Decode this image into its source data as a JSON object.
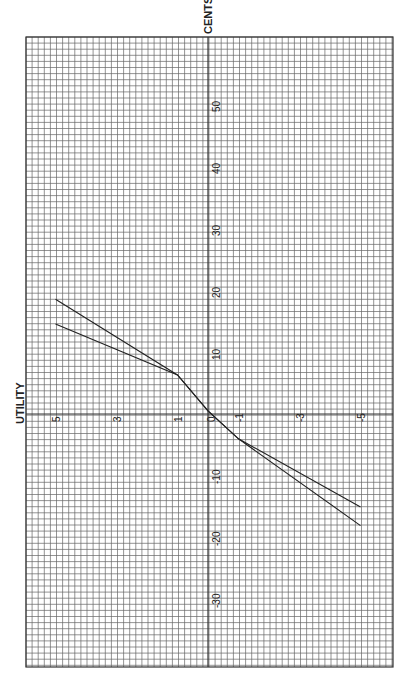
{
  "chart_data": {
    "type": "line",
    "title": "",
    "xlabel": "UTILITY",
    "ylabel": "CENTS",
    "orientation_note": "rotated 90 degrees on page",
    "utility_ticks": [
      "5",
      "3",
      "1",
      "0",
      "-1",
      "-3",
      "-5"
    ],
    "cents_ticks": [
      "50",
      "40",
      "30",
      "20",
      "10",
      "-10",
      "-20",
      "-30"
    ],
    "xlim": [
      5,
      -6
    ],
    "ylim": [
      -40,
      60
    ],
    "grid": true,
    "series": [
      {
        "name": "curve A",
        "points": [
          [
            5,
            18.5
          ],
          [
            1,
            6.3
          ],
          [
            0,
            0.5
          ],
          [
            -1,
            -4
          ],
          [
            -5,
            -15
          ]
        ]
      },
      {
        "name": "curve B",
        "points": [
          [
            5,
            14.5
          ],
          [
            1,
            6.3
          ],
          [
            0,
            0.5
          ],
          [
            -1,
            -4
          ],
          [
            -5,
            -18
          ]
        ]
      }
    ]
  },
  "labels": {
    "cents": "CENTS",
    "utility": "UTILITY"
  }
}
